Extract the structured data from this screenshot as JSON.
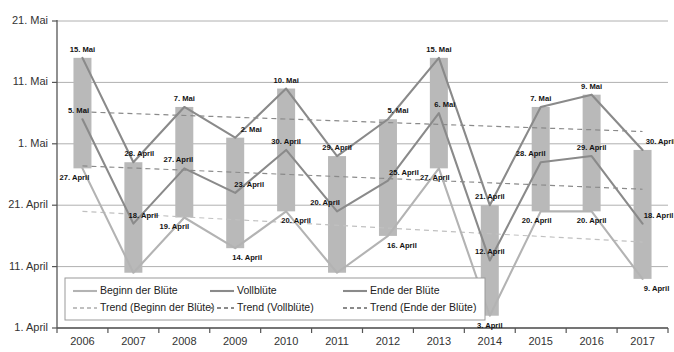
{
  "chart_data": {
    "type": "line",
    "title": "",
    "xlabel": "",
    "ylabel": "",
    "grid": true,
    "legend_position": "bottom-left",
    "categories": [
      "2006",
      "2007",
      "2008",
      "2009",
      "2010",
      "2011",
      "2012",
      "2013",
      "2014",
      "2015",
      "2016",
      "2017"
    ],
    "y_axis": {
      "ticks": [
        "1. April",
        "11. April",
        "21. April",
        "1. Mai",
        "11. Mai",
        "21. Mai"
      ],
      "tick_values": [
        1,
        11,
        21,
        31,
        41,
        51
      ],
      "ylim": [
        1,
        51
      ],
      "note": "values are day-of-year offsets counted from 1. April = 1"
    },
    "series": [
      {
        "name": "Beginn der Blüte",
        "color": "#b3b3b3",
        "style": "solid",
        "labels": [
          "27. April",
          "10. April",
          "19. April",
          "14. April",
          "20. April",
          "10. April",
          "16. April",
          "27. April",
          "3. April",
          "20. April",
          "20. April",
          "9. April"
        ],
        "values": [
          27,
          10,
          19,
          14,
          20,
          10,
          16,
          27,
          3,
          20,
          20,
          9
        ]
      },
      {
        "name": "Vollblüte",
        "color": "#8a8a8a",
        "style": "solid",
        "labels": [
          "5. Mai",
          "18. April",
          "27. April",
          "23. April",
          "30. April",
          "20. April",
          "25. April",
          "6. Mai",
          "12. April",
          "28. April",
          "29. April",
          "18. April"
        ],
        "values": [
          35,
          18,
          27,
          23,
          30,
          20,
          25,
          36,
          12,
          28,
          29,
          18
        ]
      },
      {
        "name": "Ende der Blüte",
        "color": "#8a8a8a",
        "style": "solid",
        "labels": [
          "15. Mai",
          "28. April",
          "7. Mai",
          "2. Mai",
          "10. Mai",
          "29. April",
          "5. Mai",
          "15. Mai",
          "21. April",
          "7. Mai",
          "9. Mai",
          "30. April"
        ],
        "values": [
          45,
          28,
          37,
          32,
          40,
          29,
          35,
          45,
          21,
          37,
          39,
          30
        ]
      }
    ],
    "trends": [
      {
        "name": "Trend (Beginn der Blüte)",
        "color": "#c0c0c0",
        "style": "dashed",
        "start_value": 20.0,
        "end_value": 15.0
      },
      {
        "name": "Trend (Vollblüte)",
        "color": "#8a8a8a",
        "style": "dashed",
        "start_value": 27.4,
        "end_value": 23.6
      },
      {
        "name": "Trend (Ende der Blüte)",
        "color": "#8a8a8a",
        "style": "dashed",
        "start_value": 36.2,
        "end_value": 33.0
      }
    ],
    "bars": {
      "name": "Blütezeitraum (Beginn bis Ende der Blüte)",
      "color": "#b9b9b9",
      "from_series": "Beginn der Blüte",
      "to_series": "Ende der Blüte"
    }
  },
  "legend": {
    "entries": [
      {
        "label": "Beginn der Blüte",
        "style": "solid",
        "color": "#b3b3b3"
      },
      {
        "label": "Vollblüte",
        "style": "solid",
        "color": "#8a8a8a"
      },
      {
        "label": "Ende der Blüte",
        "style": "solid",
        "color": "#8a8a8a"
      },
      {
        "label": "Trend (Beginn der Blüte)",
        "style": "dashed",
        "color": "#c0c0c0"
      },
      {
        "label": "Trend (Vollblüte)",
        "style": "dashed",
        "color": "#8a8a8a"
      },
      {
        "label": "Trend (Ende der Blüte)",
        "style": "dashed",
        "color": "#8a8a8a"
      }
    ]
  }
}
